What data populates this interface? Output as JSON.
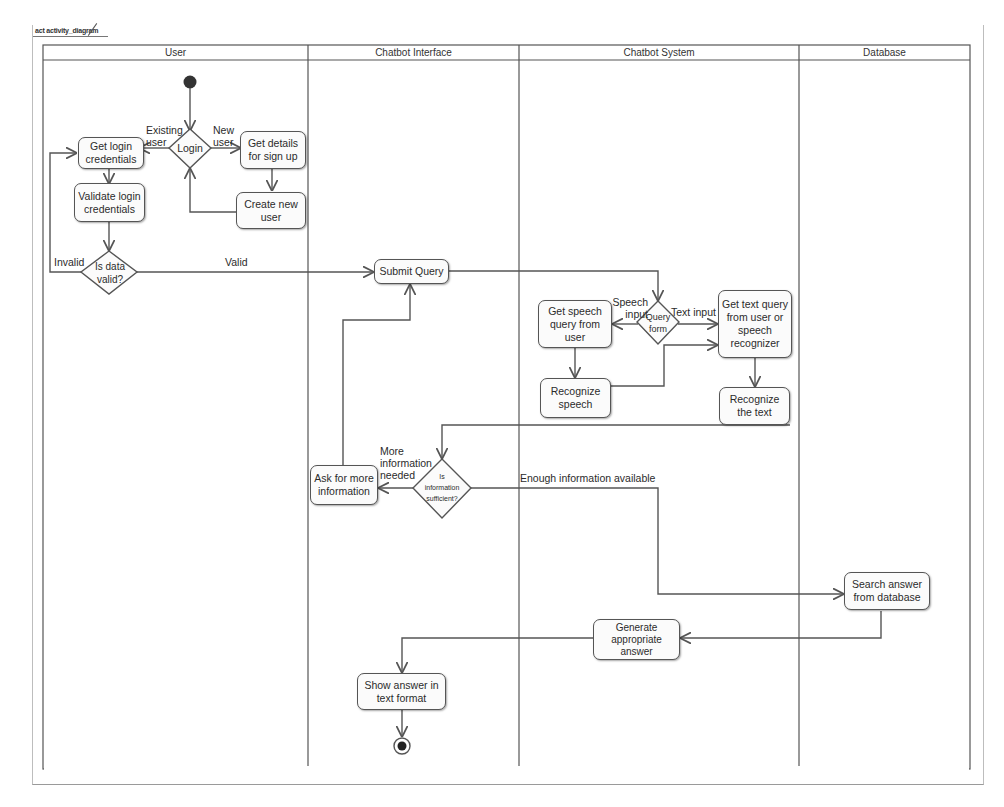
{
  "frame": {
    "tag": "act activity_diagram"
  },
  "lanes": [
    {
      "name": "User"
    },
    {
      "name": "Chatbot Interface"
    },
    {
      "name": "Chatbot System"
    },
    {
      "name": "Database"
    }
  ],
  "nodes": {
    "start": {
      "type": "initial"
    },
    "login": {
      "type": "decision",
      "label": "Login"
    },
    "get_login": {
      "type": "action",
      "label_lines": [
        "Get login",
        "credentials"
      ],
      "label": "Get login credentials"
    },
    "validate_login": {
      "type": "action",
      "label": "Validate login credentials"
    },
    "get_signup": {
      "type": "action",
      "label": "Get details for sign up"
    },
    "create_user": {
      "type": "action",
      "label": "Create new user"
    },
    "is_valid": {
      "type": "decision",
      "line1": "Is data",
      "line2": "valid?"
    },
    "submit_query": {
      "type": "action",
      "label": "Submit Query"
    },
    "query_form": {
      "type": "decision",
      "line1": "Query",
      "line2": "form"
    },
    "get_speech": {
      "type": "action",
      "label": "Get speech query from user"
    },
    "recognize_speech": {
      "type": "action",
      "label": "Recognize speech"
    },
    "get_text": {
      "type": "action",
      "label": "Get text query from user or speech recognizer"
    },
    "recognize_text": {
      "type": "action",
      "label": "Recognize the text"
    },
    "info_sufficient": {
      "type": "decision",
      "line1": "Is",
      "line2": "information",
      "line3": "sufficient?"
    },
    "ask_more": {
      "type": "action",
      "label": "Ask for more information"
    },
    "search_db": {
      "type": "action",
      "label": "Search answer from database"
    },
    "generate_answer": {
      "type": "action",
      "label": "Generate appropriate answer"
    },
    "show_answer": {
      "type": "action",
      "label": "Show answer in text format"
    },
    "end": {
      "type": "final"
    }
  },
  "edge_labels": {
    "existing_user": "Existing user",
    "new_user": "New user",
    "invalid": "Invalid",
    "valid": "Valid",
    "speech_input": "Speech input",
    "text_input": "Text input",
    "more_info": "More information needed",
    "enough_info": "Enough information available"
  },
  "colors": {
    "line": "#555555",
    "node_fill": "#fbfbfb",
    "text": "#2b2b2b"
  }
}
